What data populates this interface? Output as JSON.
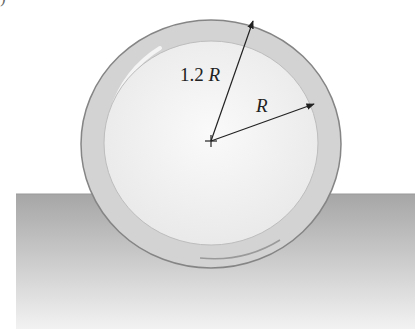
{
  "diagram": {
    "clipped_top_text": ")",
    "labels": {
      "outer_radius": {
        "prefix": "1.2 ",
        "var": "R"
      },
      "inner_radius": {
        "var": "R"
      }
    },
    "geometry": {
      "center": [
        211,
        141
      ],
      "outer_radius_px": 127,
      "inner_radius_px": 105,
      "ground_top_y": 194,
      "ground_left_x": 16
    },
    "colors": {
      "shell": "#d4d4d4",
      "shell_edge": "#8a8a8a",
      "interior": "#f3f3f3",
      "ground_top": "#a9a9a9",
      "ground_bottom": "#f0f0f0",
      "arrows": "#222222"
    }
  }
}
